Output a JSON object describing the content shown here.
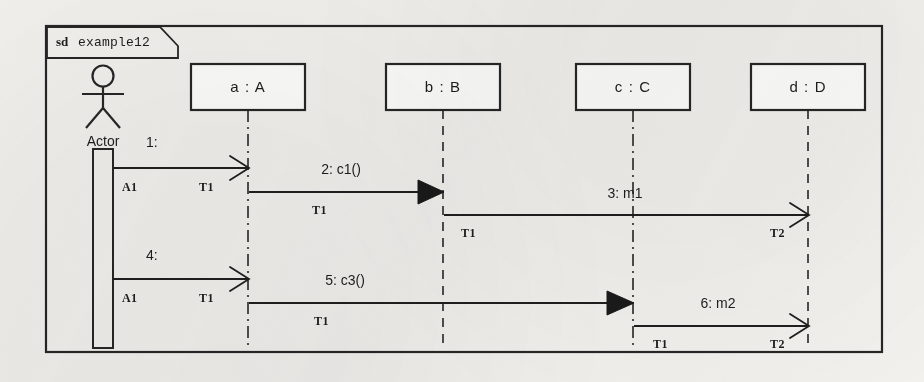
{
  "diagram": {
    "kind_keyword": "sd",
    "name": "example12",
    "type": "uml-sequence-diagram"
  },
  "actor": {
    "label": "Actor",
    "icon": "stick-figure-actor-icon"
  },
  "lifelines": [
    {
      "id": "a",
      "label": "a : A",
      "x": 248
    },
    {
      "id": "b",
      "label": "b : B",
      "x": 443
    },
    {
      "id": "c",
      "label": "c : C",
      "x": 632
    },
    {
      "id": "d",
      "label": "d : D",
      "x": 808
    }
  ],
  "messages": [
    {
      "seq": "1",
      "label": "1:",
      "from": "Actor",
      "to": "a : A",
      "arrow": "open",
      "source_tag": "A1",
      "target_tag": "T1"
    },
    {
      "seq": "2",
      "label": "2: c1()",
      "from": "a : A",
      "to": "b : B",
      "arrow": "filled",
      "source_tag": "T1",
      "target_tag": ""
    },
    {
      "seq": "3",
      "label": "3: m1",
      "from": "b : B",
      "to": "d : D",
      "arrow": "open",
      "source_tag": "T1",
      "target_tag": "T2"
    },
    {
      "seq": "4",
      "label": "4:",
      "from": "Actor",
      "to": "a : A",
      "arrow": "open",
      "source_tag": "A1",
      "target_tag": "T1"
    },
    {
      "seq": "5",
      "label": "5: c3()",
      "from": "a : A",
      "to": "c : C",
      "arrow": "filled",
      "source_tag": "T1",
      "target_tag": ""
    },
    {
      "seq": "6",
      "label": "6: m2",
      "from": "c : C",
      "to": "d : D",
      "arrow": "open",
      "source_tag": "T1",
      "target_tag": "T2"
    }
  ],
  "colors": {
    "ink": "#262626",
    "paper": "#f2f1ee",
    "box_fill": "#fdfdfb"
  }
}
